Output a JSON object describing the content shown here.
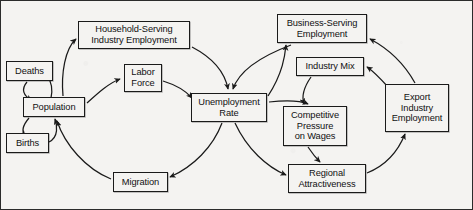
{
  "figure": {
    "background_color": "#f4f3f1",
    "line_color": "#1a1a1a",
    "box_fill": "#f4f3f1"
  },
  "nodes": [
    {
      "id": "deaths",
      "label": "Deaths",
      "x": 5,
      "y": 60,
      "w": 47,
      "h": 20
    },
    {
      "id": "births",
      "label": "Births",
      "x": 5,
      "y": 132,
      "w": 43,
      "h": 20
    },
    {
      "id": "population",
      "label": "Population",
      "x": 22,
      "y": 96,
      "w": 62,
      "h": 20
    },
    {
      "id": "household",
      "label": "Household-Serving\nIndustry  Employment",
      "x": 77,
      "y": 20,
      "w": 112,
      "h": 28
    },
    {
      "id": "labor_force",
      "label": "Labor\nForce",
      "x": 123,
      "y": 63,
      "w": 38,
      "h": 28
    },
    {
      "id": "unemployment",
      "label": "Unemployment\nRate",
      "x": 190,
      "y": 92,
      "w": 76,
      "h": 29
    },
    {
      "id": "migration",
      "label": "Migration",
      "x": 112,
      "y": 171,
      "w": 55,
      "h": 20
    },
    {
      "id": "business",
      "label": "Business-Serving\nEmployment",
      "x": 276,
      "y": 13,
      "w": 90,
      "h": 29
    },
    {
      "id": "industry_mix",
      "label": "Industry Mix",
      "x": 295,
      "y": 56,
      "w": 68,
      "h": 19
    },
    {
      "id": "competitive",
      "label": "Competitive\nPressure\non Wages",
      "x": 282,
      "y": 105,
      "w": 64,
      "h": 40
    },
    {
      "id": "regional",
      "label": "Regional\nAttractiveness",
      "x": 287,
      "y": 163,
      "w": 78,
      "h": 29
    },
    {
      "id": "export",
      "label": "Export\nIndustry\nEmployment",
      "x": 384,
      "y": 83,
      "w": 64,
      "h": 48
    }
  ],
  "edges": [
    {
      "from": "population",
      "to": "deaths",
      "name": "population-to-deaths"
    },
    {
      "from": "deaths",
      "to": "population",
      "name": "deaths-to-population"
    },
    {
      "from": "population",
      "to": "births",
      "name": "population-to-births"
    },
    {
      "from": "births",
      "to": "population",
      "name": "births-to-population"
    },
    {
      "from": "population",
      "to": "household",
      "name": "population-to-household-serving-employment"
    },
    {
      "from": "population",
      "to": "labor_force",
      "name": "population-to-labor-force"
    },
    {
      "from": "household",
      "to": "unemployment",
      "name": "household-serving-employment-to-unemployment-rate"
    },
    {
      "from": "labor_force",
      "to": "unemployment",
      "name": "labor-force-to-unemployment-rate"
    },
    {
      "from": "business",
      "to": "unemployment",
      "name": "business-serving-employment-to-unemployment-rate"
    },
    {
      "from": "unemployment",
      "to": "migration",
      "name": "unemployment-rate-to-migration"
    },
    {
      "from": "migration",
      "to": "population",
      "name": "migration-to-population"
    },
    {
      "from": "unemployment",
      "to": "regional",
      "name": "unemployment-rate-to-regional-attractiveness"
    },
    {
      "from": "unemployment",
      "to": "business",
      "name": "unemployment-rate-to-business-serving-employment"
    },
    {
      "from": "unemployment",
      "to": "competitive",
      "name": "unemployment-rate-to-competitive-pressure"
    },
    {
      "from": "industry_mix",
      "to": "competitive",
      "name": "industry-mix-to-competitive-pressure"
    },
    {
      "from": "competitive",
      "to": "regional",
      "name": "competitive-pressure-to-regional-attractiveness"
    },
    {
      "from": "regional",
      "to": "export",
      "name": "regional-attractiveness-to-export-industry-employment"
    },
    {
      "from": "export",
      "to": "business",
      "name": "export-industry-employment-to-business-serving-employment"
    },
    {
      "from": "export",
      "to": "industry_mix",
      "name": "export-industry-employment-to-industry-mix"
    }
  ]
}
